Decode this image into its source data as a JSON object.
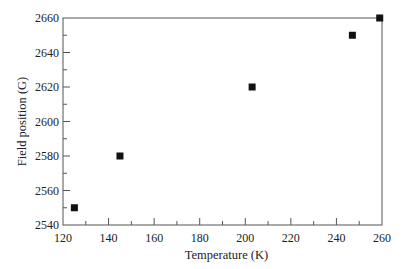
{
  "chart_data": {
    "type": "scatter",
    "title": "",
    "xlabel": "Temperature (K)",
    "ylabel": "Field position (G)",
    "xlim": [
      120,
      260
    ],
    "ylim": [
      2540,
      2660
    ],
    "x_ticks": [
      120,
      140,
      160,
      180,
      200,
      220,
      240,
      260
    ],
    "y_ticks": [
      2540,
      2560,
      2580,
      2600,
      2620,
      2640,
      2660
    ],
    "x_minor_step": 10,
    "y_minor_step": 10,
    "grid": false,
    "legend": null,
    "marker": "square",
    "marker_color": "#111111",
    "series": [
      {
        "name": "Field position",
        "x": [
          125,
          145,
          203,
          247,
          259
        ],
        "y": [
          2550,
          2580,
          2620,
          2650,
          2660
        ]
      }
    ]
  },
  "plot_area": {
    "left": 63,
    "right": 382,
    "top": 18,
    "bottom": 225
  },
  "colors": {
    "axis": "#555555",
    "marker": "#111111",
    "text": "#222222"
  }
}
